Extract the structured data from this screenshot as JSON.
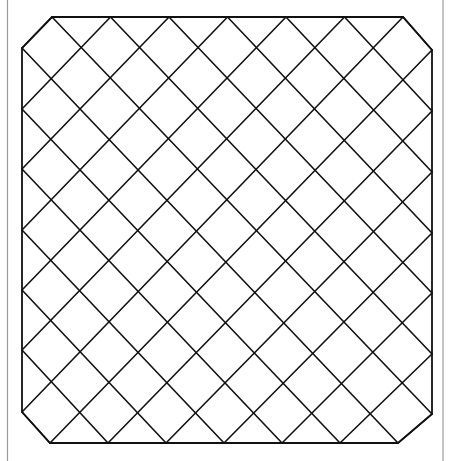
{
  "diagram": {
    "type": "octagonal-diamond-lattice",
    "canvas": {
      "width": 449,
      "height": 461
    },
    "colors": {
      "background": "#ffffff",
      "line": "#111111",
      "page_edge": "#9a9a9a"
    },
    "page_edges": [
      {
        "x": 7.5,
        "y1": 0,
        "y2": 461
      },
      {
        "x": 443,
        "y1": 0,
        "y2": 461
      }
    ],
    "octagon": [
      [
        52,
        17
      ],
      [
        403,
        17
      ],
      [
        432,
        50
      ],
      [
        432,
        414
      ],
      [
        398,
        443
      ],
      [
        50,
        443
      ],
      [
        22,
        412
      ],
      [
        22,
        48
      ]
    ],
    "boundary_vertices": {
      "top": {
        "y": 17,
        "x": [
          52,
          110.5,
          169,
          227.5,
          286,
          344.5,
          403
        ]
      },
      "bottom": {
        "y": 443,
        "x": [
          50,
          108,
          166,
          224,
          282,
          340,
          398
        ]
      },
      "left": {
        "x": 22,
        "y": [
          48,
          109,
          169,
          230,
          290,
          350,
          412
        ]
      },
      "right": {
        "x": 432,
        "y": [
          50,
          111,
          172,
          233,
          293,
          354,
          414
        ]
      }
    },
    "line_rules": {
      "down_right_from_top_i_to_right": "top[i] -> right[6-i]",
      "down_right_from_left_j_to_bottom": "left[j] -> bottom[6-j]",
      "down_left_from_top_i_to_left": "top[i] -> left[i]",
      "down_left_from_right_j_to_bottom": "right[j] -> bottom[j]"
    }
  }
}
